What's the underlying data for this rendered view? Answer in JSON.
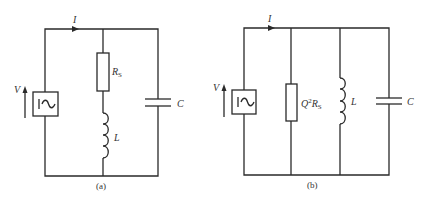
{
  "figure": {
    "diagrams": [
      {
        "id": "a",
        "caption": "(a)",
        "current_label": "I",
        "voltage_label": "V",
        "source_symbol": "|~",
        "resistor_label": "R",
        "resistor_subscript": "S",
        "inductor_label": "L",
        "capacitor_label": "C"
      },
      {
        "id": "b",
        "caption": "(b)",
        "current_label": "I",
        "voltage_label": "V",
        "source_symbol": "|~",
        "resistor_label_prefix": "Q",
        "resistor_label_power": "2",
        "resistor_label": "R",
        "resistor_subscript": "S",
        "inductor_label": "L",
        "capacitor_label": "C"
      }
    ]
  }
}
